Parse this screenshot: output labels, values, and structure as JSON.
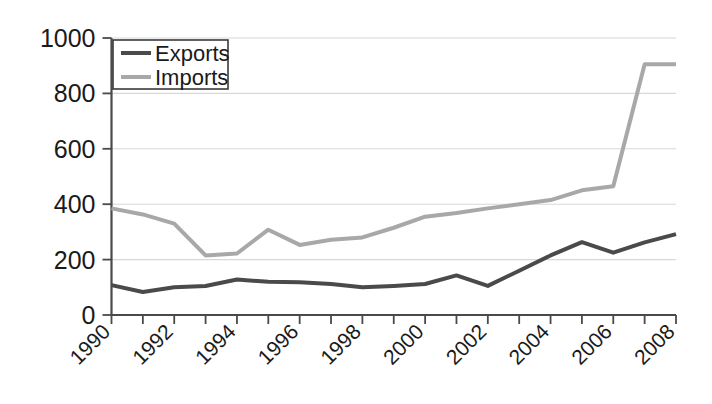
{
  "chart_data": {
    "type": "line",
    "title": "",
    "subtitle": "",
    "xlabel": "",
    "ylabel": "",
    "xlim": [
      1990,
      2008
    ],
    "ylim": [
      0,
      1000
    ],
    "grid": true,
    "legend_position": "top-left",
    "x": [
      1990,
      1991,
      1992,
      1993,
      1994,
      1995,
      1996,
      1997,
      1998,
      1999,
      2000,
      2001,
      2002,
      2003,
      2004,
      2005,
      2006,
      2007,
      2008
    ],
    "x_tick_labels": [
      "1990",
      "1992",
      "1994",
      "1996",
      "1998",
      "2000",
      "2002",
      "2004",
      "2006",
      "2008"
    ],
    "x_tick_values": [
      1990,
      1992,
      1994,
      1996,
      1998,
      2000,
      2002,
      2004,
      2006,
      2008
    ],
    "y_tick_labels": [
      "0",
      "200",
      "400",
      "600",
      "800",
      "1000"
    ],
    "y_tick_values": [
      0,
      200,
      400,
      600,
      800,
      1000
    ],
    "series": [
      {
        "name": "Exports",
        "color": "#4a4a4a",
        "width": 4,
        "values": [
          108,
          83,
          100,
          105,
          128,
          120,
          118,
          112,
          100,
          105,
          112,
          143,
          105,
          160,
          215,
          263,
          225,
          262,
          292
        ]
      },
      {
        "name": "Imports",
        "color": "#a8a8a8",
        "width": 4,
        "values": [
          385,
          363,
          330,
          215,
          222,
          308,
          253,
          272,
          280,
          315,
          355,
          368,
          385,
          400,
          415,
          450,
          465,
          905,
          905
        ]
      }
    ]
  },
  "legend": {
    "items": [
      {
        "label": "Exports",
        "color": "#4a4a4a"
      },
      {
        "label": "Imports",
        "color": "#a8a8a8"
      }
    ]
  },
  "axes": {
    "y_ticks": [
      {
        "label": "1000",
        "value": 1000
      },
      {
        "label": "800",
        "value": 800
      },
      {
        "label": "600",
        "value": 600
      },
      {
        "label": "400",
        "value": 400
      },
      {
        "label": "200",
        "value": 200
      },
      {
        "label": "0",
        "value": 0
      }
    ],
    "x_ticks": [
      {
        "label": "1990",
        "value": 1990
      },
      {
        "label": "1992",
        "value": 1992
      },
      {
        "label": "1994",
        "value": 1994
      },
      {
        "label": "1996",
        "value": 1996
      },
      {
        "label": "1998",
        "value": 1998
      },
      {
        "label": "2000",
        "value": 2000
      },
      {
        "label": "2002",
        "value": 2002
      },
      {
        "label": "2004",
        "value": 2004
      },
      {
        "label": "2006",
        "value": 2006
      },
      {
        "label": "2008",
        "value": 2008
      }
    ]
  }
}
